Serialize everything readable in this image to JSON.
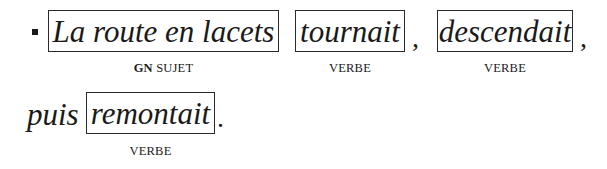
{
  "line1": {
    "bullet": "square-bullet",
    "groups": [
      {
        "text": "La route en lacets",
        "label_bold": "GN",
        "label": "SUJET"
      },
      {
        "text": "tournait",
        "label": "VERBE",
        "after": ","
      },
      {
        "text": "descendait",
        "label": "VERBE",
        "after": ","
      }
    ]
  },
  "line2": {
    "prefix": "puis",
    "groups": [
      {
        "text": "remontait",
        "label": "VERBE",
        "after": "."
      }
    ]
  }
}
